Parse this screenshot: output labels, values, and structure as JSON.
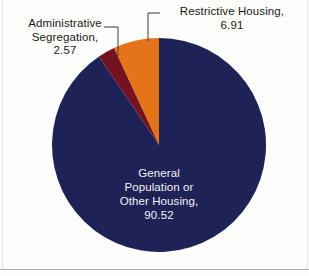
{
  "chart_data": {
    "type": "pie",
    "title": "",
    "subtitle": "",
    "xlabel": "",
    "ylabel": "",
    "units": "percent",
    "legend_position": "none",
    "grid": false,
    "total": 100.0,
    "start_angle_deg": 0,
    "direction": "counterclockwise",
    "categories": [
      "Restrictive Housing",
      "Administrative Segregation",
      "General Population or Other Housing"
    ],
    "values": [
      6.91,
      2.57,
      90.52
    ],
    "slices": [
      {
        "label": "Restrictive Housing",
        "value": 6.91,
        "value_text": "6.91",
        "color": "#e4731a",
        "label_placement": "outside-callout",
        "callout_text": "Restrictive Housing,\n6.91"
      },
      {
        "label": "Administrative Segregation",
        "value": 2.57,
        "value_text": "2.57",
        "color": "#74131f",
        "label_placement": "outside-callout",
        "callout_text": "Administrative\nSegregation,\n2.57"
      },
      {
        "label": "General Population or Other Housing",
        "value": 90.52,
        "value_text": "90.52",
        "color": "#1e2257",
        "label_placement": "inside",
        "callout_text": "General\nPopulation or\nOther Housing,\n90.52"
      }
    ],
    "annotations": [
      "Restrictive Housing, 6.91",
      "Administrative Segregation, 2.57",
      "General Population or Other Housing, 90.52"
    ]
  },
  "labels": {
    "restrictive_housing": "Restrictive Housing,\n6.91",
    "administrative_segregation": "Administrative\nSegregation,\n2.57",
    "general_population": "General\nPopulation or\nOther Housing,\n90.52"
  },
  "colors": {
    "navy": "#1e2257",
    "orange": "#e4731a",
    "maroon": "#74131f",
    "background": "#fdfdfc",
    "inside_text": "#f2f2f2",
    "outside_text": "#1a1a1a",
    "leader_line": "#4a4a4a"
  }
}
